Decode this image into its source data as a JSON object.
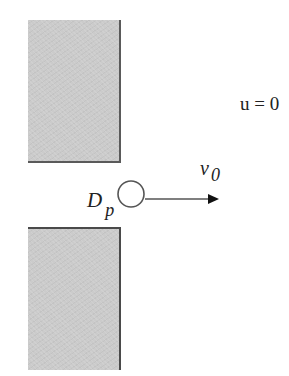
{
  "diagram": {
    "title": "",
    "walls": [
      {
        "id": "upper-wall",
        "x": 28,
        "y": 20,
        "width": 93,
        "height": 143,
        "fill": "#cbcbcb"
      },
      {
        "id": "lower-wall",
        "x": 28,
        "y": 227,
        "width": 93,
        "height": 143,
        "fill": "#cbcbcb"
      }
    ],
    "particle": {
      "cx": 131,
      "cy": 194,
      "r": 13,
      "stroke": "#555555"
    },
    "velocity_arrow": {
      "x1": 145,
      "y1": 199,
      "x2": 219,
      "y2": 199,
      "stroke": "#444444"
    },
    "labels": {
      "fluid_velocity": "u = 0",
      "particle_velocity_symbol": "v",
      "particle_velocity_subscript": "0",
      "particle_diameter_symbol": "D",
      "particle_diameter_subscript": "p"
    }
  }
}
